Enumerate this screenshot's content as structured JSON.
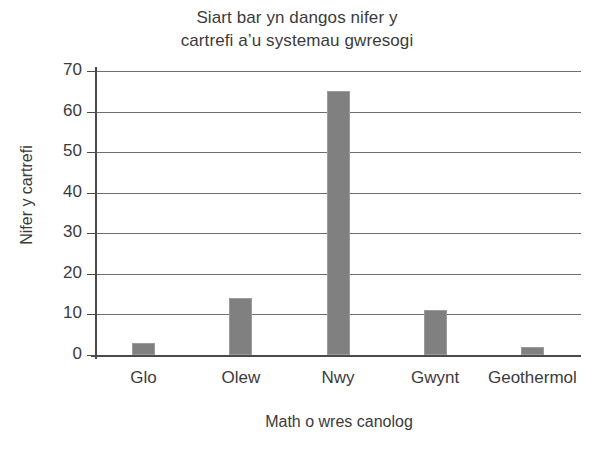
{
  "chart_data": {
    "type": "bar",
    "title_line1": "Siart bar yn dangos nifer y",
    "title_line2": "cartrefi a’u systemau gwresogi",
    "xlabel": "Math o wres canolog",
    "ylabel": "Nifer y cartrefi",
    "categories": [
      "Glo",
      "Olew",
      "Nwy",
      "Gwynt",
      "Geothermol"
    ],
    "values": [
      3,
      14,
      65,
      11,
      2
    ],
    "ylim": [
      0,
      70
    ],
    "ytick_labels": [
      "0",
      "10",
      "20",
      "30",
      "40",
      "50",
      "60",
      "70"
    ],
    "ytick_values": [
      0,
      10,
      20,
      30,
      40,
      50,
      60,
      70
    ],
    "grid": true,
    "grid_axis": "y",
    "legend": "none",
    "bar_color": "#808080",
    "bar_edge_color": "#9b9b9b",
    "axis_color": "#4a4a4a",
    "grid_color": "#6e6e6e",
    "text_color": "#3b3b3b",
    "background_color": "#ffffff"
  }
}
